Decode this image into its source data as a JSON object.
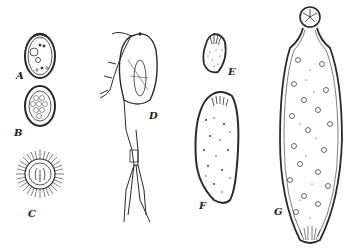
{
  "figure": {
    "panels": [
      {
        "id": "A",
        "label": "A"
      },
      {
        "id": "B",
        "label": "B"
      },
      {
        "id": "C",
        "label": "C"
      },
      {
        "id": "D",
        "label": "D"
      },
      {
        "id": "E",
        "label": "E"
      },
      {
        "id": "F",
        "label": "F"
      },
      {
        "id": "G",
        "label": "G"
      }
    ],
    "colors": {
      "ink": "#2a2a2a",
      "background": "#ffffff"
    }
  }
}
